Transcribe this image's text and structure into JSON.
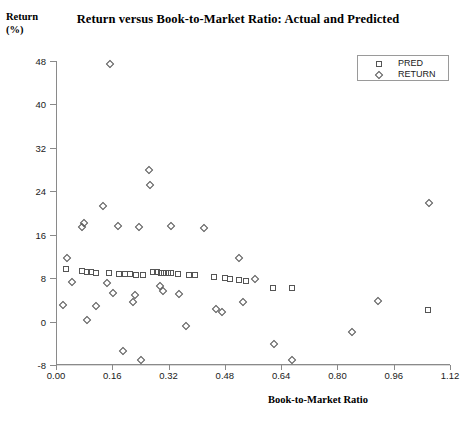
{
  "chart_data": {
    "type": "scatter",
    "title": "Return versus Book-to-Market Ratio: Actual and Predicted",
    "xlabel": "Book-to-Market Ratio",
    "ylabel_line1": "Return",
    "ylabel_line2": "(%)",
    "xlim": [
      0.0,
      1.12
    ],
    "ylim": [
      -8,
      48
    ],
    "xticks": [
      "0.00",
      "0.16",
      "0.32",
      "0.48",
      "0.64",
      "0.80",
      "0.96",
      "1.12"
    ],
    "xtick_values": [
      0.0,
      0.16,
      0.32,
      0.48,
      0.64,
      0.8,
      0.96,
      1.12
    ],
    "yticks": [
      "48",
      "40",
      "32",
      "24",
      "16",
      "8",
      "0",
      "-8"
    ],
    "ytick_values": [
      48,
      40,
      32,
      24,
      16,
      8,
      0,
      -8
    ],
    "grid": "horizontal",
    "legend_position": "top-right",
    "marker_color": "#555555",
    "series": [
      {
        "name": "PRED",
        "marker": "square",
        "points": [
          [
            0.025,
            9.6
          ],
          [
            0.072,
            9.3
          ],
          [
            0.085,
            9.2
          ],
          [
            0.097,
            9.2
          ],
          [
            0.112,
            9.0
          ],
          [
            0.147,
            9.0
          ],
          [
            0.175,
            8.8
          ],
          [
            0.192,
            8.8
          ],
          [
            0.208,
            8.7
          ],
          [
            0.225,
            8.6
          ],
          [
            0.245,
            8.6
          ],
          [
            0.272,
            9.1
          ],
          [
            0.285,
            9.1
          ],
          [
            0.295,
            9.0
          ],
          [
            0.305,
            9.0
          ],
          [
            0.315,
            8.9
          ],
          [
            0.325,
            8.9
          ],
          [
            0.345,
            8.8
          ],
          [
            0.375,
            8.6
          ],
          [
            0.392,
            8.5
          ],
          [
            0.445,
            8.2
          ],
          [
            0.478,
            8.0
          ],
          [
            0.492,
            7.9
          ],
          [
            0.518,
            7.6
          ],
          [
            0.538,
            7.5
          ],
          [
            0.615,
            6.2
          ],
          [
            0.668,
            6.1
          ],
          [
            1.055,
            2.1
          ]
        ]
      },
      {
        "name": "RETURN",
        "marker": "diamond",
        "points": [
          [
            0.018,
            3.0
          ],
          [
            0.028,
            11.8
          ],
          [
            0.042,
            7.3
          ],
          [
            0.072,
            17.4
          ],
          [
            0.078,
            18.2
          ],
          [
            0.085,
            0.2
          ],
          [
            0.112,
            2.9
          ],
          [
            0.132,
            21.2
          ],
          [
            0.142,
            7.1
          ],
          [
            0.152,
            47.5
          ],
          [
            0.158,
            5.2
          ],
          [
            0.172,
            17.6
          ],
          [
            0.188,
            -5.4
          ],
          [
            0.215,
            3.6
          ],
          [
            0.222,
            4.9
          ],
          [
            0.232,
            17.5
          ],
          [
            0.238,
            -7.0
          ],
          [
            0.262,
            28.0
          ],
          [
            0.265,
            25.2
          ],
          [
            0.292,
            6.6
          ],
          [
            0.302,
            5.7
          ],
          [
            0.325,
            17.6
          ],
          [
            0.348,
            5.1
          ],
          [
            0.368,
            -0.9
          ],
          [
            0.418,
            17.2
          ],
          [
            0.452,
            2.3
          ],
          [
            0.468,
            1.8
          ],
          [
            0.518,
            11.8
          ],
          [
            0.528,
            3.6
          ],
          [
            0.562,
            7.9
          ],
          [
            0.618,
            -4.1
          ],
          [
            0.668,
            -7.1
          ],
          [
            0.838,
            -2.0
          ],
          [
            0.912,
            3.8
          ],
          [
            1.058,
            21.9
          ]
        ]
      }
    ]
  },
  "legend": {
    "entries": [
      {
        "label": "PRED",
        "symbol": "square-marker-icon"
      },
      {
        "label": "RETURN",
        "symbol": "diamond-marker-icon"
      }
    ]
  }
}
